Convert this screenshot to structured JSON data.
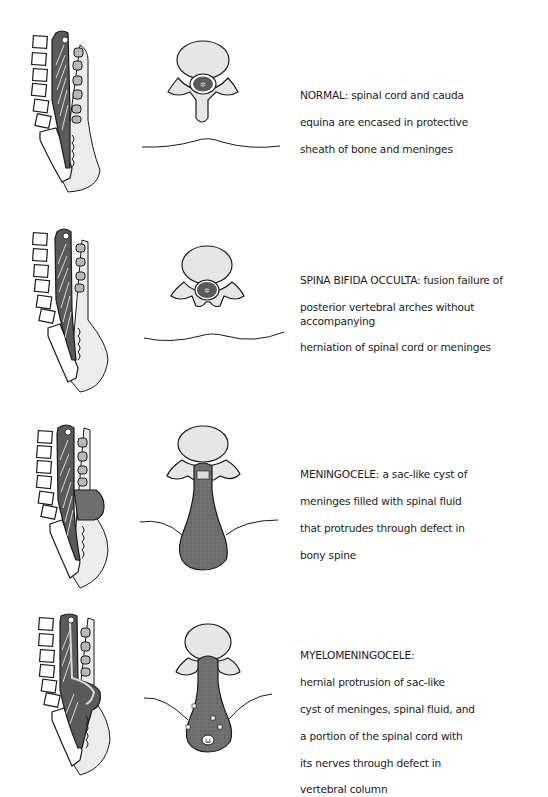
{
  "figure": {
    "panels": [
      {
        "id": "normal",
        "title": "NORMAL:",
        "description": "spinal cord and cauda equina are encased in protective sheath of bone and meninges",
        "lines": [
          "NORMAL: spinal cord and cauda",
          "equina are encased in protective",
          "sheath of bone and meninges"
        ],
        "sagittal_view": "sagittal-spine-normal",
        "axial_view": "axial-vertebra-normal"
      },
      {
        "id": "spina-bifida-occulta",
        "title": "SPINA BIFIDA OCCULTA:",
        "description": "fusion failure of posterior vertebral arches without accompanying herniation of spinal cord or meninges",
        "lines": [
          "SPINA BIFIDA OCCULTA: fusion failure of",
          "posterior vertebral arches without accompanying",
          "herniation of spinal cord or meninges"
        ],
        "sagittal_view": "sagittal-spine-occulta",
        "axial_view": "axial-vertebra-occulta"
      },
      {
        "id": "meningocele",
        "title": "MENINGOCELE:",
        "description": "a sac-like cyst of meninges filled with spinal fluid that protrudes through defect in bony spine",
        "lines": [
          "MENINGOCELE: a sac-like cyst of",
          "meninges filled with spinal fluid",
          "that protrudes through defect in",
          "bony spine"
        ],
        "sagittal_view": "sagittal-spine-meningocele",
        "axial_view": "axial-vertebra-meningocele"
      },
      {
        "id": "myelomeningocele",
        "title": "MYELOMENINGOCELE:",
        "description": "hernial protrusion of sac-like cyst of meninges, spinal fluid, and a portion of the spinal cord with its nerves through defect in vertebral column",
        "lines": [
          "MYELOMENINGOCELE:",
          "hernial protrusion of sac-like",
          "cyst of meninges, spinal fluid, and",
          "a portion of the spinal cord with",
          "its nerves through defect in",
          "vertebral column"
        ],
        "sagittal_view": "sagittal-spine-myelomeningocele",
        "axial_view": "axial-vertebra-myelomeningocele"
      }
    ],
    "colors": {
      "outline": "#1a1a1a",
      "cord_dark": "#5a5a5a",
      "sac_fill": "#6e6e6e",
      "bone_light": "#e6e6e6",
      "soft_tissue": "#ececec",
      "vertebral_body_fill": "#b8b8b8",
      "text": "#1a1a1a"
    }
  }
}
